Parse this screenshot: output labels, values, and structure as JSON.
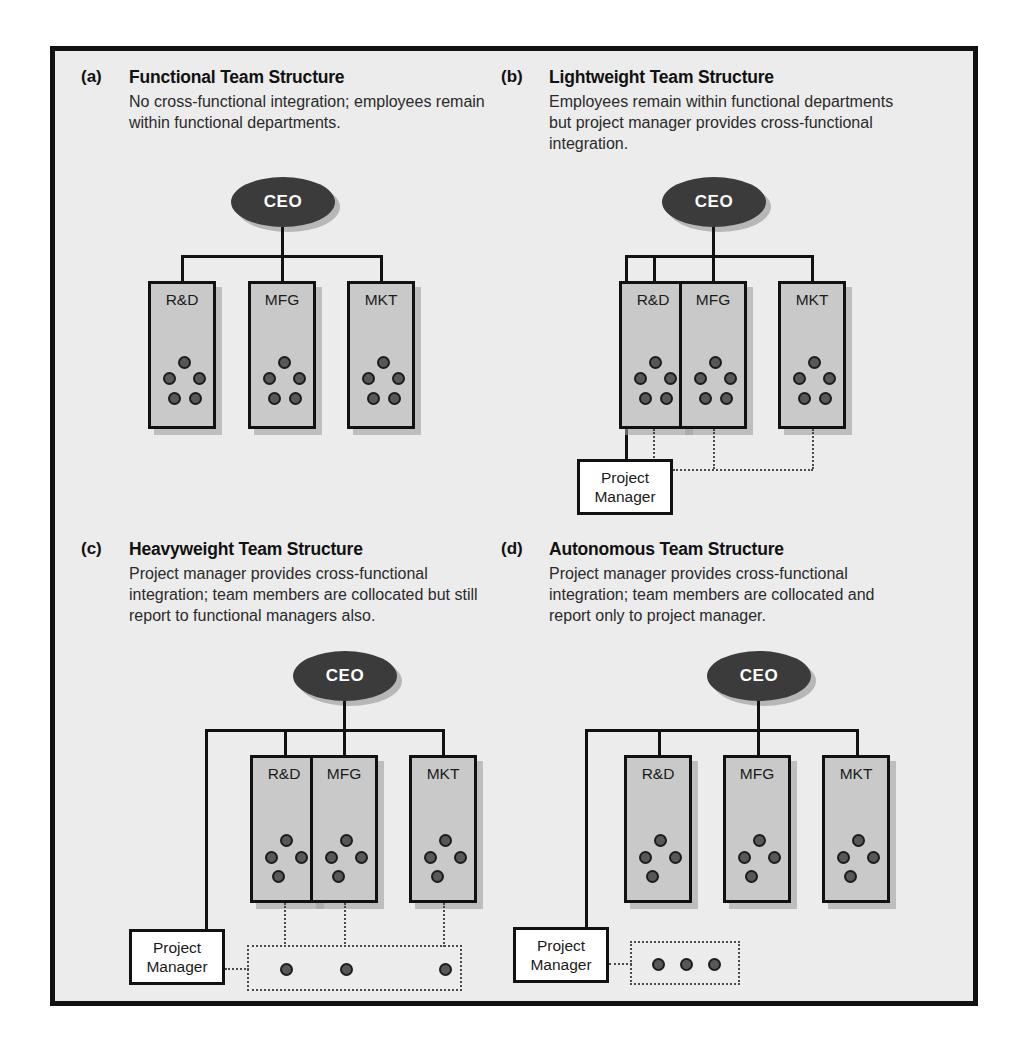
{
  "figure": {
    "background_color": "#ececec",
    "frame_color": "#111111"
  },
  "labels": {
    "ceo": "CEO",
    "project_manager_line1": "Project",
    "project_manager_line2": "Manager",
    "departments": [
      "R&D",
      "MFG",
      "MKT"
    ]
  },
  "panels": [
    {
      "letter": "(a)",
      "title": "Functional Team Structure",
      "description": "No cross-functional integration; employees remain within functional departments.",
      "dots_per_department": 5,
      "has_project_manager": false,
      "has_team_box": false
    },
    {
      "letter": "(b)",
      "title": "Lightweight Team Structure",
      "description": "Employees remain within functional departments but project manager provides cross-functional integration.",
      "dots_per_department": 5,
      "has_project_manager": true,
      "has_team_box": false
    },
    {
      "letter": "(c)",
      "title": "Heavyweight Team Structure",
      "description": "Project manager provides cross-functional integration; team members are collocated but still report to functional managers also.",
      "dots_per_department": 4,
      "has_project_manager": true,
      "has_team_box": true,
      "team_box_dots": 3,
      "team_box_wide": true
    },
    {
      "letter": "(d)",
      "title": "Autonomous Team Structure",
      "description": "Project manager provides cross-functional integration; team members are collocated and report only to project manager.",
      "dots_per_department": 4,
      "has_project_manager": true,
      "has_team_box": true,
      "team_box_dots": 3,
      "team_box_wide": false
    }
  ]
}
